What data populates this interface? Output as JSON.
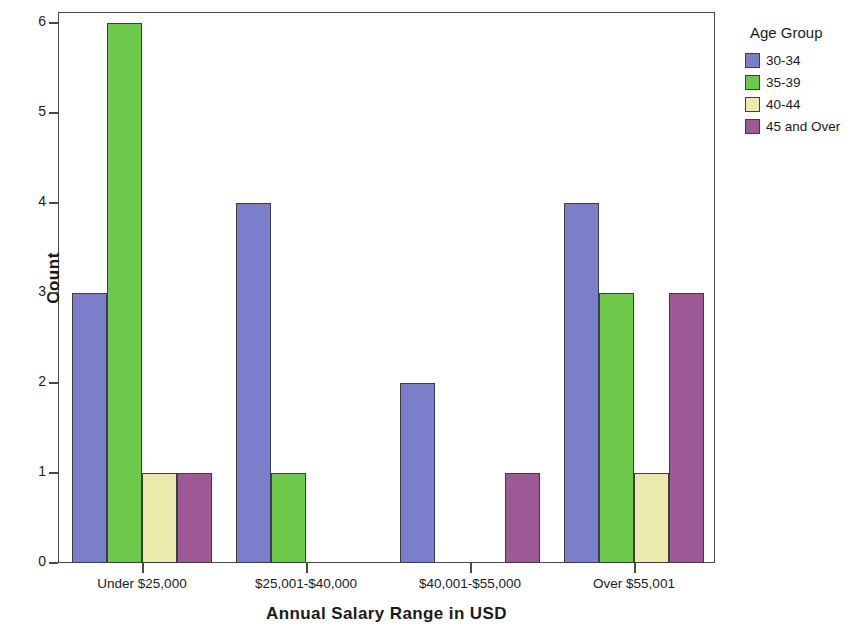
{
  "chart_data": {
    "type": "bar",
    "title": "",
    "xlabel": "Annual Salary Range in USD",
    "ylabel": "Count",
    "categories": [
      "Under $25,000",
      "$25,001-$40,000",
      "$40,001-$55,000",
      "Over $55,001"
    ],
    "ylim": [
      0,
      6
    ],
    "yticks": [
      0,
      1,
      2,
      3,
      4,
      5,
      6
    ],
    "ytick_labels": [
      "0",
      "1",
      "2",
      "3",
      "4",
      "5",
      "6"
    ],
    "grid": false,
    "legend_title": "Age Group",
    "legend_position": "right",
    "series": [
      {
        "name": "30-34",
        "color": "#7b7ec8",
        "values": [
          3,
          4,
          2,
          4
        ]
      },
      {
        "name": "35-39",
        "color": "#6cc94a",
        "values": [
          6,
          1,
          0,
          3
        ]
      },
      {
        "name": "40-44",
        "color": "#ece9ad",
        "values": [
          1,
          0,
          0,
          1
        ]
      },
      {
        "name": "45 and Over",
        "color": "#9d5a96",
        "values": [
          1,
          0,
          1,
          3
        ]
      }
    ]
  },
  "axis": {
    "border_color": "#4a4a4a",
    "bar_outline_color": "#3c3c46"
  }
}
